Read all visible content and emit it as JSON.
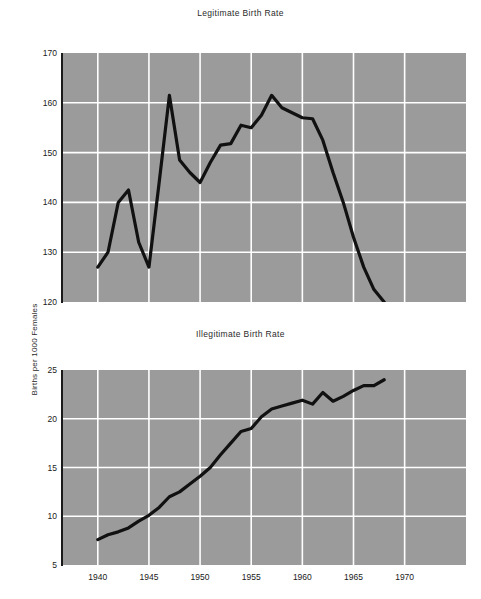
{
  "figure": {
    "background": "#ffffff",
    "plot_background": "#9b9b9b",
    "grid_color": "#ffffff",
    "line_color": "#111111",
    "axis_label": "Births per 1000 Females"
  },
  "chart_data": [
    {
      "type": "line",
      "title": "Legitimate Birth Rate",
      "xlabel": "",
      "ylabel": "Births per 1000 Females",
      "xlim": [
        1936.5,
        1976.0
      ],
      "ylim": [
        120,
        170
      ],
      "xticks": [
        1940,
        1945,
        1950,
        1955,
        1960,
        1965,
        1970
      ],
      "xticklabels": [
        "1940",
        "1945",
        "1950",
        "1955",
        "1960",
        "1965",
        "1970"
      ],
      "yticks": [
        120,
        130,
        140,
        150,
        160,
        170
      ],
      "yticklabels": [
        "120",
        "130",
        "140",
        "150",
        "160",
        "170"
      ],
      "grid": true,
      "legend": "none",
      "x": [
        1940,
        1941,
        1942,
        1943,
        1944,
        1945,
        1946,
        1947,
        1948,
        1949,
        1950,
        1951,
        1952,
        1953,
        1954,
        1955,
        1956,
        1957,
        1958,
        1959,
        1960,
        1961,
        1962,
        1963,
        1964,
        1965,
        1966,
        1967,
        1968
      ],
      "values": [
        127.0,
        130.0,
        140.0,
        142.5,
        132.0,
        127.0,
        144.0,
        161.5,
        148.5,
        146.0,
        144.0,
        148.0,
        151.5,
        151.8,
        155.5,
        155.0,
        157.5,
        161.5,
        159.0,
        158.0,
        157.0,
        156.8,
        152.5,
        146.0,
        140.0,
        133.0,
        127.0,
        122.5,
        120.0
      ]
    },
    {
      "type": "line",
      "title": "Illegitimate Birth Rate",
      "xlabel": "",
      "ylabel": "Births per 1000 Females",
      "xlim": [
        1936.5,
        1976.0
      ],
      "ylim": [
        5,
        25
      ],
      "xticks": [
        1940,
        1945,
        1950,
        1955,
        1960,
        1965,
        1970
      ],
      "xticklabels": [
        "1940",
        "1945",
        "1950",
        "1955",
        "1960",
        "1965",
        "1970"
      ],
      "yticks": [
        5,
        10,
        15,
        20,
        25
      ],
      "yticklabels": [
        "5",
        "10",
        "15",
        "20",
        "25"
      ],
      "grid": true,
      "legend": "none",
      "x": [
        1940,
        1941,
        1942,
        1943,
        1944,
        1945,
        1946,
        1947,
        1948,
        1949,
        1950,
        1951,
        1952,
        1953,
        1954,
        1955,
        1956,
        1957,
        1958,
        1959,
        1960,
        1961,
        1962,
        1963,
        1964,
        1965,
        1966,
        1967,
        1968
      ],
      "values": [
        7.6,
        8.1,
        8.4,
        8.8,
        9.5,
        10.1,
        10.9,
        12.0,
        12.5,
        13.3,
        14.1,
        15.0,
        16.3,
        17.5,
        18.7,
        19.0,
        20.2,
        21.0,
        21.3,
        21.6,
        21.9,
        21.5,
        22.7,
        21.8,
        22.3,
        22.9,
        23.4,
        23.4,
        24.0
      ]
    }
  ],
  "ticks_top": {
    "y": [
      "170",
      "160",
      "150",
      "140",
      "130",
      "120"
    ],
    "x": [
      "1940",
      "1945",
      "1950",
      "1955",
      "1960",
      "1965",
      "1970"
    ]
  },
  "ticks_bottom": {
    "y": [
      "25",
      "20",
      "15",
      "10",
      "5"
    ],
    "x": [
      "1940",
      "1945",
      "1950",
      "1955",
      "1960",
      "1965",
      "1970"
    ]
  },
  "titles": {
    "top": "Legitimate Birth Rate",
    "bottom": "Illegitimate Birth Rate"
  }
}
